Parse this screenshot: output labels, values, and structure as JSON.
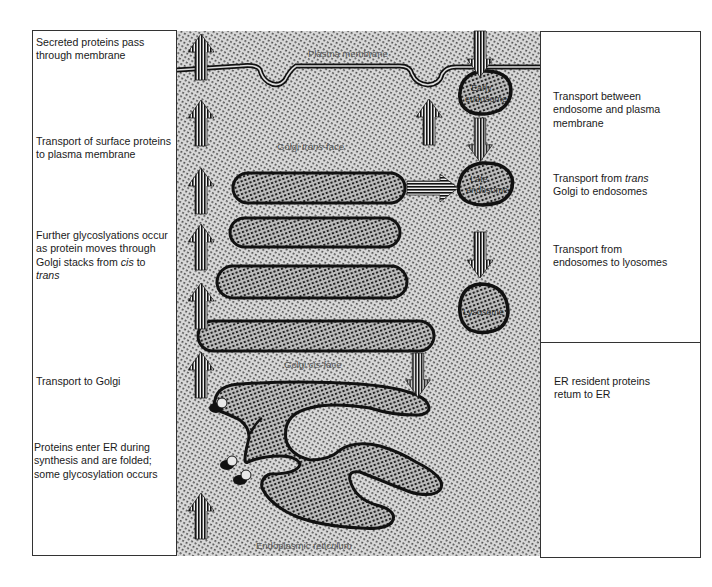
{
  "left_captions": [
    {
      "id": "secreted",
      "text": "Secreted proteins pass through membrane"
    },
    {
      "id": "surface",
      "text_pre": "Transport of surface proteins to plasma membrane"
    },
    {
      "id": "glyco",
      "line1": "Further glycoslyations occur",
      "line2": "as protein moves through",
      "line3_pre": "Golgi stacks from ",
      "line3_it": "cis",
      "line3_post": " to",
      "line4_it": "trans"
    },
    {
      "id": "to-golgi",
      "text": "Transport to Golgi"
    },
    {
      "id": "enter-er",
      "line1": "Proteins enter ER during",
      "line2": "synthesis and are folded;",
      "line3": "some glycosylation occurs"
    }
  ],
  "right_captions": [
    {
      "id": "endo-pm",
      "line1": "Transport between",
      "line2": "endosome and plasma",
      "line3": "membrane"
    },
    {
      "id": "trans-endo",
      "line1_pre": "Transport from ",
      "line1_it": "trans",
      "line2": "Golgi to endosomes"
    },
    {
      "id": "endo-lyso",
      "line1": "Transport from",
      "line2": "endosomes to lyosomes"
    },
    {
      "id": "er-resident",
      "line1": "ER resident proteins",
      "line2": "retum to ER"
    }
  ],
  "diagram_labels": {
    "plasma_membrane": "Plasma membrane",
    "golgi_trans_pre": "Golgi ",
    "golgi_trans_it": "trans",
    "golgi_trans_post": "-face",
    "golgi_cis_pre": "Golgi ",
    "golgi_cis_it": "cis",
    "golgi_cis_post": "-face",
    "er": "Endoplasmic reticulum",
    "early_endosome_1": "Early",
    "early_endosome_2": "endosome",
    "late_endosome_1": "Late",
    "late_endosome_2": "endosome",
    "lysosome": "Lysosome"
  },
  "colors": {
    "ink": "#111111",
    "stipple_bg": "#c8c8c8",
    "organelle_fill": "#9a9a9a",
    "panel_border": "#333333"
  }
}
